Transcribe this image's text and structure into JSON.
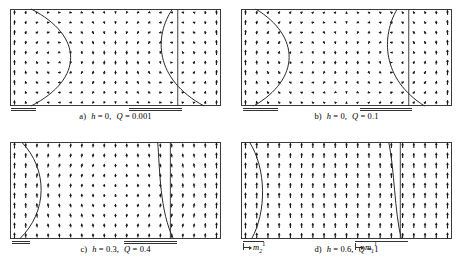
{
  "figure": {
    "type": "vector-field-grid",
    "panel_count": 4,
    "frame": {
      "width": 211,
      "height": 97,
      "border_color": "#3a3a3a"
    }
  },
  "panels": [
    {
      "id": "a",
      "tag": "a)",
      "h_symbol": "h",
      "h_value": "0",
      "q_symbol": "Q",
      "q_value": "0.001",
      "caption": "a)  h = 0,  Q = 0.001",
      "grid_cols": 19,
      "grid_rows": 10,
      "vortices": [
        {
          "cx": 0.27,
          "cy": 0.5,
          "sense": "ccw",
          "radius": 0.22,
          "strength": 1.0
        },
        {
          "cx": 0.72,
          "cy": 0.5,
          "sense": "cw",
          "radius": 0.22,
          "strength": 1.0
        }
      ],
      "uniform_y": 0.0,
      "profile_curves": [
        {
          "name": "left-wall",
          "top_x": 0.1,
          "mid_x": 0.3,
          "bot_x": 0.1,
          "bow": 0.2
        },
        {
          "name": "right-wall",
          "top_x": 0.77,
          "mid_x": 0.7,
          "bot_x": 0.92,
          "bow": -0.07
        }
      ],
      "ref_line_x": 0.795,
      "bars": [
        {
          "x0": 0.005,
          "x1": 0.125,
          "double": true
        },
        {
          "x0": 0.565,
          "x1": 0.815,
          "double": true
        }
      ]
    },
    {
      "id": "b",
      "tag": "b)",
      "h_symbol": "h",
      "h_value": "0",
      "q_symbol": "Q",
      "q_value": "0.1",
      "caption": "b)  h = 0,  Q = 0.1",
      "grid_cols": 19,
      "grid_rows": 10,
      "vortices": [
        {
          "cx": 0.27,
          "cy": 0.5,
          "sense": "ccw",
          "radius": 0.22,
          "strength": 0.95
        },
        {
          "cx": 0.72,
          "cy": 0.5,
          "sense": "cw",
          "radius": 0.22,
          "strength": 0.95
        }
      ],
      "uniform_y": 0.12,
      "profile_curves": [
        {
          "name": "left-wall",
          "top_x": 0.07,
          "mid_x": 0.24,
          "bot_x": 0.06,
          "bow": 0.17
        },
        {
          "name": "right-wall",
          "top_x": 0.74,
          "mid_x": 0.68,
          "bot_x": 0.87,
          "bow": -0.06
        }
      ],
      "ref_line_x": 0.795,
      "bars": [
        {
          "x0": 0.01,
          "x1": 0.175,
          "double": true
        },
        {
          "x0": 0.565,
          "x1": 0.81,
          "double": true
        }
      ]
    },
    {
      "id": "c",
      "tag": "c)",
      "h_symbol": "h",
      "h_value": "0.3",
      "q_symbol": "Q",
      "q_value": "0.4",
      "caption": "c)  h = 0.3,  Q = 0.4",
      "grid_cols": 19,
      "grid_rows": 10,
      "vortices": [
        {
          "cx": 0.27,
          "cy": 0.5,
          "sense": "ccw",
          "radius": 0.2,
          "strength": 0.55
        },
        {
          "cx": 0.72,
          "cy": 0.5,
          "sense": "cw",
          "radius": 0.2,
          "strength": 0.55
        }
      ],
      "uniform_y": 0.55,
      "profile_curves": [
        {
          "name": "left-wall",
          "top_x": 0.055,
          "mid_x": 0.155,
          "bot_x": 0.045,
          "bow": 0.1
        },
        {
          "name": "right-wall",
          "top_x": 0.7,
          "mid_x": 0.715,
          "bot_x": 0.775,
          "bow": -0.02
        }
      ],
      "ref_line_x": 0.76,
      "bars": [
        {
          "x0": 0.01,
          "x1": 0.095,
          "double": true
        },
        {
          "x0": 0.54,
          "x1": 0.79,
          "double": true
        }
      ]
    },
    {
      "id": "d",
      "tag": "d)",
      "h_symbol": "h",
      "h_value": "0.6",
      "q_symbol": "Q",
      "q_value": "1",
      "caption": "d)  h = 0.6,  Q = 1",
      "grid_cols": 19,
      "grid_rows": 10,
      "vortices": [
        {
          "cx": 0.27,
          "cy": 0.5,
          "sense": "ccw",
          "radius": 0.17,
          "strength": 0.22
        },
        {
          "cx": 0.72,
          "cy": 0.5,
          "sense": "cw",
          "radius": 0.17,
          "strength": 0.22
        }
      ],
      "uniform_y": 0.86,
      "profile_curves": [
        {
          "name": "left-wall",
          "top_x": 0.04,
          "mid_x": 0.105,
          "bot_x": 0.05,
          "bow": 0.065
        },
        {
          "name": "right-wall",
          "top_x": 0.7,
          "mid_x": 0.73,
          "bot_x": 0.76,
          "bow": -0.01
        }
      ],
      "ref_line_x": 0.755,
      "bars": [
        {
          "x0": 0.01,
          "x1": 0.11,
          "double": false
        },
        {
          "x0": 0.54,
          "x1": 0.79,
          "double": false
        }
      ],
      "measure_labels": [
        {
          "name": "m2",
          "base": "m",
          "sub": "2",
          "sup": "1",
          "x0": 0.01,
          "x1": 0.11
        },
        {
          "name": "m1",
          "base": "m",
          "sub": "1",
          "sup": "1",
          "x0": 0.54,
          "x1": 0.79
        }
      ]
    }
  ],
  "chart_data": {
    "type": "scatter",
    "title": "",
    "xlabel": "",
    "ylabel": "",
    "series": [
      {
        "name": "panel-a-field",
        "note": "two counter-rotating vortices, h = 0, Q = 0.001"
      },
      {
        "name": "panel-b-field",
        "note": "two counter-rotating vortices, h = 0, Q = 0.1"
      },
      {
        "name": "panel-c-field",
        "note": "partially aligned field, h = 0.3, Q = 0.4"
      },
      {
        "name": "panel-d-field",
        "note": "nearly uniform vertical field, h = 0.6, Q = 1"
      }
    ]
  }
}
